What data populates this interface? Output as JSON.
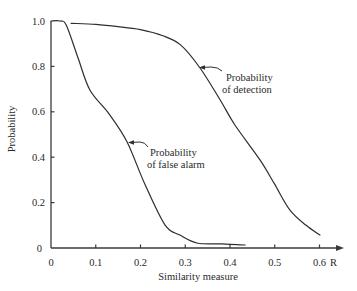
{
  "chart_data": {
    "type": "line",
    "title": "",
    "xlabel": "Similarity measure",
    "ylabel": "Probability",
    "x_axis_end_label": "R",
    "xlim": [
      0,
      0.6
    ],
    "ylim": [
      0,
      1.0
    ],
    "grid": false,
    "legend": "inline annotations with leader arrows",
    "x_ticks": [
      0,
      0.1,
      0.2,
      0.3,
      0.4,
      0.5,
      0.6
    ],
    "x_tick_labels": [
      "0",
      "0.1",
      "0.2",
      "0.3",
      "0.4",
      "0.5",
      "0.6"
    ],
    "y_ticks": [
      0,
      0.2,
      0.4,
      0.6,
      0.8,
      1.0
    ],
    "y_tick_labels": [
      "0",
      "0.2",
      "0.4",
      "0.6",
      "0.8",
      "1.0"
    ],
    "series": [
      {
        "name": "Probability of detection",
        "annotation_lines": [
          "Probability",
          "of detection"
        ],
        "x": [
          0.045,
          0.1,
          0.15,
          0.2,
          0.25,
          0.29,
          0.333,
          0.378,
          0.411,
          0.467,
          0.5,
          0.534,
          0.57,
          0.601
        ],
        "y": [
          0.99,
          0.985,
          0.975,
          0.962,
          0.935,
          0.894,
          0.793,
          0.652,
          0.542,
          0.388,
          0.28,
          0.167,
          0.1,
          0.057
        ]
      },
      {
        "name": "Probability of false alarm",
        "annotation_lines": [
          "Probability",
          "of false alarm"
        ],
        "x": [
          0.0,
          0.02,
          0.034,
          0.06,
          0.087,
          0.13,
          0.17,
          0.21,
          0.255,
          0.288,
          0.326,
          0.38,
          0.434
        ],
        "y": [
          1.0,
          1.0,
          0.982,
          0.84,
          0.696,
          0.59,
          0.467,
          0.28,
          0.101,
          0.057,
          0.022,
          0.018,
          0.013
        ]
      }
    ]
  }
}
